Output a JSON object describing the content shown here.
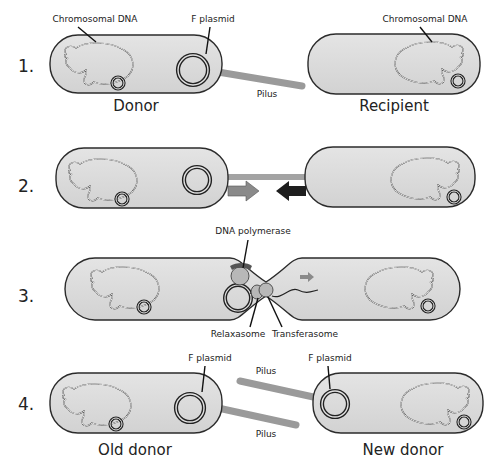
{
  "diagram": {
    "colors": {
      "cell_fill": "#dcdcdc",
      "cell_stroke": "#2b2b2b",
      "pilus": "#9a9a9a",
      "arrow_gray": "#8a8a8a",
      "arrow_dark": "#1e1e1e",
      "protein": "#b8b8b8",
      "text": "#222222"
    },
    "steps": [
      {
        "number": "1.",
        "labels": {
          "donor_chromosome": "Chromosomal DNA",
          "donor_plasmid": "F plasmid",
          "pilus": "Pilus",
          "recipient_chromosome": "Chromosomal DNA",
          "donor_cell": "Donor",
          "recipient_cell": "Recipient"
        }
      },
      {
        "number": "2.",
        "labels": {}
      },
      {
        "number": "3.",
        "labels": {
          "polymerase": "DNA polymerase",
          "relaxasome": "Relaxasome",
          "transferasome": "Transferasome"
        }
      },
      {
        "number": "4.",
        "labels": {
          "old_plasmid": "F plasmid",
          "new_plasmid": "F plasmid",
          "pilus_top": "Pilus",
          "pilus_bottom": "Pilus",
          "old_cell": "Old donor",
          "new_cell": "New donor"
        }
      }
    ]
  }
}
